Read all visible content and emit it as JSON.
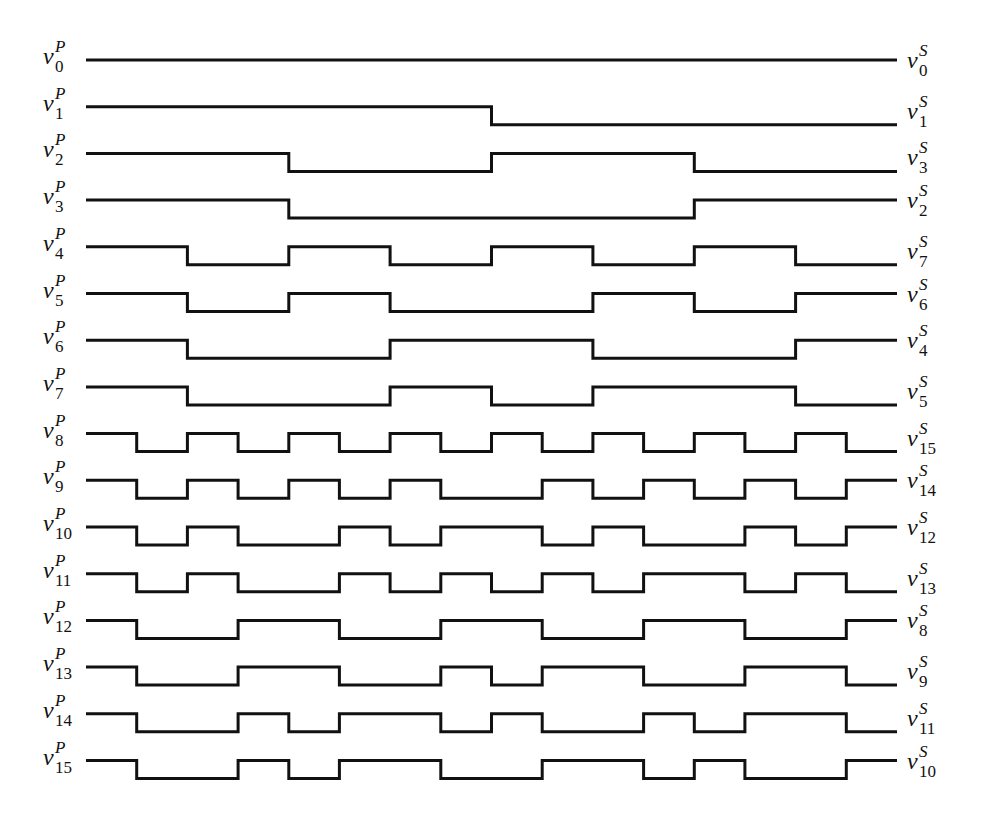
{
  "diagram": {
    "title": "",
    "type": "timing-diagram",
    "segments": 16,
    "line_color": "#111111",
    "background": "#ffffff",
    "left_label_base": "v",
    "left_label_sup": "P",
    "right_label_base": "v",
    "right_label_sup": "S",
    "rows": [
      {
        "left_index": "0",
        "right_index": "0",
        "bits": "1111111111111111"
      },
      {
        "left_index": "1",
        "right_index": "1",
        "bits": "1111111100000000"
      },
      {
        "left_index": "2",
        "right_index": "3",
        "bits": "1111000011110000"
      },
      {
        "left_index": "3",
        "right_index": "2",
        "bits": "1111000000001111"
      },
      {
        "left_index": "4",
        "right_index": "7",
        "bits": "1100110011001100"
      },
      {
        "left_index": "5",
        "right_index": "6",
        "bits": "1100110000110011"
      },
      {
        "left_index": "6",
        "right_index": "4",
        "bits": "1100001111000011"
      },
      {
        "left_index": "7",
        "right_index": "5",
        "bits": "1100001100111100"
      },
      {
        "left_index": "8",
        "right_index": "15",
        "bits": "1010101010101010"
      },
      {
        "left_index": "9",
        "right_index": "14",
        "bits": "1010101001010101"
      },
      {
        "left_index": "10",
        "right_index": "12",
        "bits": "1010010110100101"
      },
      {
        "left_index": "11",
        "right_index": "13",
        "bits": "1010010101011010"
      },
      {
        "left_index": "12",
        "right_index": "8",
        "bits": "1001100110011001"
      },
      {
        "left_index": "13",
        "right_index": "9",
        "bits": "1001100101100110"
      },
      {
        "left_index": "14",
        "right_index": "11",
        "bits": "1001011010010110"
      },
      {
        "left_index": "15",
        "right_index": "10",
        "bits": "1001011001101001"
      }
    ]
  }
}
